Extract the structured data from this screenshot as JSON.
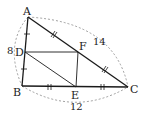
{
  "diagram": {
    "type": "geometry-triangle",
    "points": {
      "A": {
        "label": "A",
        "x": 28,
        "y": 17
      },
      "B": {
        "label": "B",
        "x": 22,
        "y": 86
      },
      "C": {
        "label": "C",
        "x": 128,
        "y": 87
      },
      "D": {
        "label": "D",
        "x": 25,
        "y": 52
      },
      "E": {
        "label": "E",
        "x": 76,
        "y": 87
      },
      "F": {
        "label": "F",
        "x": 78,
        "y": 52
      }
    },
    "measurements": {
      "AB": "8",
      "AC": "14",
      "BC": "12"
    },
    "segments": [
      "AB",
      "BC",
      "CA",
      "DF",
      "FE",
      "DE"
    ],
    "tick_marks": {
      "AD_DB": "single",
      "AF_FC": "double-slash",
      "BE_EC": "double"
    },
    "colors": {
      "line": "#1a1a1a",
      "dashed_arc": "#888888"
    }
  }
}
